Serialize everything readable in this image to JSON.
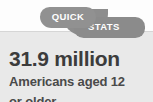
{
  "card": {
    "background_color": "#fdfdfd",
    "panel_color": "#e9e9e9"
  },
  "badge": {
    "accent_color": "#8e8e8e",
    "text_color": "#ffffff",
    "pill_top_label": "QUICK",
    "pill_bottom_label": "STATS"
  },
  "stat": {
    "headline": "31.9 million",
    "headline_color": "#3c3c3c",
    "description_line_1": "Americans aged 12",
    "description_line_2": "or older",
    "description_color": "#4a4a4a"
  }
}
